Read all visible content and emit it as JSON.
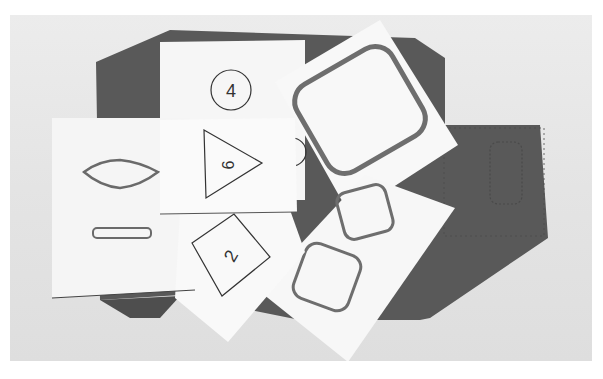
{
  "photo": {
    "description": "Paper cut-out cards with outlined shapes and numbers arranged over a dark gray felt mat",
    "colors": {
      "background": "#e6e6e6",
      "mat": "#5a5a5a",
      "card": "#f7f7f7",
      "outline": "#333333",
      "thick_outline": "#6e6e6e"
    },
    "cards": [
      {
        "id": "circle-card",
        "shape": "circle",
        "label": "4"
      },
      {
        "id": "triangle-card",
        "shape": "triangle",
        "label": "9"
      },
      {
        "id": "diamond-card",
        "shape": "diamond",
        "label": "2"
      },
      {
        "id": "lozenge-card",
        "shape": "lozenge-and-slot",
        "label": ""
      },
      {
        "id": "rounded-square-card",
        "shape": "rounded-square",
        "label": ""
      },
      {
        "id": "two-squares-card",
        "shape": "two-rounded-squares",
        "label": ""
      }
    ]
  },
  "caption": {
    "text": ""
  }
}
